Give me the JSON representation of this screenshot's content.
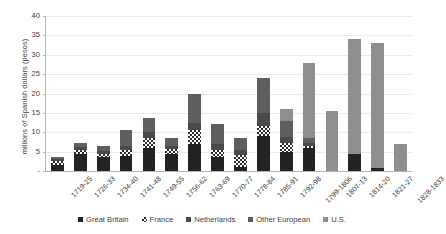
{
  "chart_data": {
    "type": "bar",
    "title": "",
    "subtitle": "",
    "xlabel": "",
    "ylabel": "millions of Spanish dollars (pesos)",
    "ylim": [
      0,
      40
    ],
    "ytick_values": [
      0,
      5,
      10,
      15,
      20,
      25,
      30,
      35,
      40
    ],
    "ytick_labels": [
      "-",
      "5",
      "10",
      "15",
      "20",
      "25",
      "30",
      "35",
      "40"
    ],
    "grid": true,
    "stacked": true,
    "legend_position": "bottom",
    "categories": [
      "1719-25",
      "1726-33",
      "1734-40",
      "1741-48",
      "1749-55",
      "1756-62",
      "1763-69",
      "1770-77",
      "1778-84",
      "1785-91",
      "1792-98",
      "1799-1806",
      "1807-13",
      "1814-20",
      "1821-27",
      "1828-1833"
    ],
    "series": [
      {
        "name": "Great Britain",
        "color": "#232323",
        "pattern": "solid",
        "values": [
          1.6,
          4.3,
          3.6,
          4.0,
          6.0,
          4.5,
          7.0,
          3.5,
          1.0,
          9.0,
          5.0,
          6.0,
          0.0,
          4.3,
          0.8,
          0.0
        ]
      },
      {
        "name": "France",
        "color": "#2b2b2b",
        "pattern": "hatched",
        "values": [
          0.9,
          1.2,
          0.9,
          1.5,
          2.6,
          1.1,
          3.5,
          2.0,
          3.2,
          2.5,
          2.2,
          0.5,
          0.0,
          0.0,
          0.0,
          0.0
        ]
      },
      {
        "name": "Netherlands",
        "color": "#4a4a4a",
        "pattern": "solid",
        "values": [
          0.5,
          0.6,
          0.7,
          0.9,
          1.4,
          0.8,
          2.0,
          1.6,
          1.2,
          3.5,
          1.6,
          0.7,
          0.0,
          0.0,
          0.0,
          0.0
        ]
      },
      {
        "name": "Other European",
        "color": "#5f5f5f",
        "pattern": "solid",
        "values": [
          0.6,
          1.1,
          1.3,
          4.3,
          3.6,
          2.2,
          7.5,
          5.0,
          3.0,
          9.0,
          4.2,
          1.3,
          0.0,
          0.0,
          0.0,
          0.0
        ]
      },
      {
        "name": "U.S.",
        "color": "#8e8e8e",
        "pattern": "solid",
        "values": [
          0.0,
          0.0,
          0.0,
          0.0,
          0.0,
          0.0,
          0.0,
          0.0,
          0.0,
          0.0,
          3.0,
          19.5,
          15.5,
          29.7,
          32.2,
          7.0
        ]
      }
    ],
    "totals": [
      3.6,
      7.2,
      6.5,
      10.7,
      13.6,
      8.6,
      20.0,
      12.1,
      8.4,
      24.0,
      16.0,
      28.0,
      15.5,
      34.0,
      33.0,
      7.0
    ]
  },
  "legend": {
    "items": [
      {
        "label": "Great Britain"
      },
      {
        "label": "France"
      },
      {
        "label": "Netherlands"
      },
      {
        "label": "Other European"
      },
      {
        "label": "U.S."
      }
    ]
  }
}
